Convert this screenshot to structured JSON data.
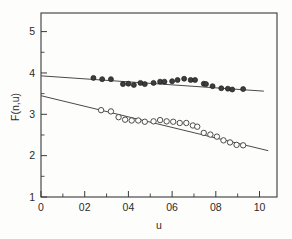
{
  "chart_data": {
    "type": "scatter",
    "title": "",
    "xlabel": "u",
    "ylabel": "F(n,u)",
    "xlim": [
      0,
      1.08
    ],
    "ylim": [
      1,
      5.45
    ],
    "grid": false,
    "legend": "none",
    "x_ticks": [
      0,
      0.2,
      0.4,
      0.6,
      0.8,
      1.0
    ],
    "x_tick_labels": [
      "0",
      "02",
      "04",
      "06",
      "08",
      "10"
    ],
    "x_tick_values": [
      0.0,
      0.2,
      0.4,
      0.6,
      0.8,
      1.0
    ],
    "x_minor_step": 0.1,
    "y_ticks": [
      1,
      2,
      3,
      4,
      5
    ],
    "y_tick_labels": [
      "1",
      "2",
      "3",
      "4",
      "5"
    ],
    "y_minor_step": 0.5,
    "series": [
      {
        "name": "upper-filled",
        "marker": "filled-circle",
        "x": [
          0.24,
          0.28,
          0.32,
          0.375,
          0.4,
          0.425,
          0.455,
          0.475,
          0.515,
          0.545,
          0.565,
          0.6,
          0.625,
          0.655,
          0.685,
          0.705,
          0.745,
          0.755,
          0.785,
          0.825,
          0.855,
          0.875,
          0.925
        ],
        "y": [
          3.88,
          3.85,
          3.85,
          3.73,
          3.74,
          3.71,
          3.76,
          3.73,
          3.76,
          3.79,
          3.79,
          3.8,
          3.83,
          3.86,
          3.83,
          3.83,
          3.74,
          3.73,
          3.68,
          3.63,
          3.62,
          3.6,
          3.61
        ]
      },
      {
        "name": "lower-open",
        "marker": "open-circle",
        "x": [
          0.275,
          0.32,
          0.355,
          0.385,
          0.415,
          0.445,
          0.475,
          0.515,
          0.545,
          0.575,
          0.605,
          0.635,
          0.665,
          0.695,
          0.715,
          0.745,
          0.775,
          0.805,
          0.835,
          0.865,
          0.895,
          0.925
        ],
        "y": [
          3.1,
          3.07,
          2.93,
          2.87,
          2.85,
          2.85,
          2.82,
          2.83,
          2.86,
          2.83,
          2.82,
          2.79,
          2.79,
          2.73,
          2.7,
          2.55,
          2.51,
          2.46,
          2.37,
          2.32,
          2.26,
          2.25
        ]
      }
    ],
    "fit_lines": [
      {
        "name": "upper-fit",
        "x0": 0.0,
        "y0": 3.93,
        "x1": 1.02,
        "y1": 3.56
      },
      {
        "name": "lower-fit",
        "x0": 0.0,
        "y0": 3.45,
        "x1": 1.04,
        "y1": 2.12
      }
    ]
  }
}
